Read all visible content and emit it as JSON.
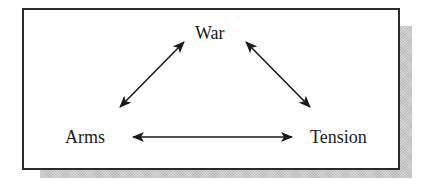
{
  "diagram": {
    "type": "triangle-relationship",
    "nodes": [
      {
        "id": "war",
        "label": "War"
      },
      {
        "id": "arms",
        "label": "Arms"
      },
      {
        "id": "tension",
        "label": "Tension"
      }
    ],
    "edges": [
      {
        "from": "arms",
        "to": "war",
        "direction": "bidirectional"
      },
      {
        "from": "war",
        "to": "tension",
        "direction": "bidirectional"
      },
      {
        "from": "arms",
        "to": "tension",
        "direction": "bidirectional"
      }
    ],
    "colors": {
      "line": "#1a1a1a",
      "border": "#2a2a2a",
      "shadow": "#c9c9c9",
      "background": "#ffffff"
    }
  }
}
